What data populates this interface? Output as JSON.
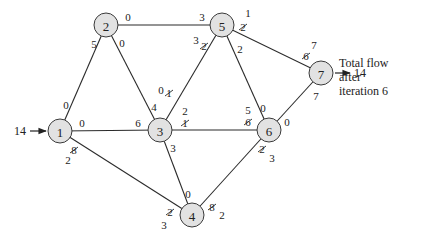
{
  "diagram": {
    "title": "Total flow after iteration 6",
    "caption_lines": [
      "Total flow",
      "after",
      "iteration 6"
    ],
    "source_flow": "14",
    "sink_flow": "14",
    "nodes": [
      {
        "id": "1",
        "label": "1",
        "x": 60,
        "y": 131
      },
      {
        "id": "2",
        "label": "2",
        "x": 106,
        "y": 25
      },
      {
        "id": "3",
        "label": "3",
        "x": 160,
        "y": 130
      },
      {
        "id": "4",
        "label": "4",
        "x": 192,
        "y": 215
      },
      {
        "id": "5",
        "label": "5",
        "x": 222,
        "y": 25
      },
      {
        "id": "6",
        "label": "6",
        "x": 269,
        "y": 130
      },
      {
        "id": "7",
        "label": "7",
        "x": 321,
        "y": 73
      }
    ],
    "edges": [
      {
        "from": "1",
        "to": "2",
        "labels": [
          {
            "text": "0",
            "x": 66,
            "y": 105
          },
          {
            "text": "5",
            "x": 94,
            "y": 44
          }
        ]
      },
      {
        "from": "1",
        "to": "3",
        "labels": [
          {
            "text": "0",
            "x": 82,
            "y": 123
          },
          {
            "text": "6",
            "x": 138,
            "y": 123
          }
        ]
      },
      {
        "from": "1",
        "to": "4",
        "labels": [
          {
            "text": "8",
            "x": 74,
            "y": 150,
            "struck": true
          },
          {
            "text": "2",
            "x": 68,
            "y": 160
          },
          {
            "text": "2",
            "x": 170,
            "y": 212,
            "struck": true
          },
          {
            "text": "3",
            "x": 164,
            "y": 225
          }
        ]
      },
      {
        "from": "2",
        "to": "3",
        "labels": [
          {
            "text": "0",
            "x": 122,
            "y": 43
          },
          {
            "text": "4",
            "x": 154,
            "y": 107
          }
        ]
      },
      {
        "from": "2",
        "to": "5",
        "labels": [
          {
            "text": "0",
            "x": 128,
            "y": 17
          },
          {
            "text": "3",
            "x": 202,
            "y": 17
          }
        ]
      },
      {
        "from": "3",
        "to": "5",
        "labels": [
          {
            "text": "0",
            "x": 161,
            "y": 90
          },
          {
            "text": "1",
            "x": 169,
            "y": 93,
            "struck": true
          },
          {
            "text": "3",
            "x": 196,
            "y": 40
          },
          {
            "text": "2",
            "x": 204,
            "y": 46,
            "struck": true
          }
        ]
      },
      {
        "from": "3",
        "to": "6",
        "labels": [
          {
            "text": "2",
            "x": 185,
            "y": 111
          },
          {
            "text": "1",
            "x": 185,
            "y": 123,
            "struck": true
          },
          {
            "text": "5",
            "x": 248,
            "y": 110
          },
          {
            "text": "6",
            "x": 248,
            "y": 122,
            "struck": true
          }
        ]
      },
      {
        "from": "3",
        "to": "4",
        "labels": [
          {
            "text": "3",
            "x": 173,
            "y": 148
          },
          {
            "text": "0",
            "x": 188,
            "y": 194
          }
        ]
      },
      {
        "from": "4",
        "to": "6",
        "labels": [
          {
            "text": "8",
            "x": 212,
            "y": 207,
            "struck": true
          },
          {
            "text": "2",
            "x": 222,
            "y": 215
          },
          {
            "text": "2",
            "x": 262,
            "y": 149,
            "struck": true
          },
          {
            "text": "3",
            "x": 272,
            "y": 158
          }
        ]
      },
      {
        "from": "5",
        "to": "6",
        "labels": [
          {
            "text": "2",
            "x": 240,
            "y": 49
          },
          {
            "text": "0",
            "x": 263,
            "y": 108
          }
        ]
      },
      {
        "from": "5",
        "to": "7",
        "labels": [
          {
            "text": "1",
            "x": 248,
            "y": 13
          },
          {
            "text": "2",
            "x": 243,
            "y": 27,
            "struck": true
          },
          {
            "text": "7",
            "x": 314,
            "y": 45
          },
          {
            "text": "6",
            "x": 306,
            "y": 56,
            "struck": true
          }
        ]
      },
      {
        "from": "6",
        "to": "7",
        "labels": [
          {
            "text": "0",
            "x": 287,
            "y": 122
          },
          {
            "text": "7",
            "x": 316,
            "y": 96
          }
        ]
      }
    ]
  }
}
